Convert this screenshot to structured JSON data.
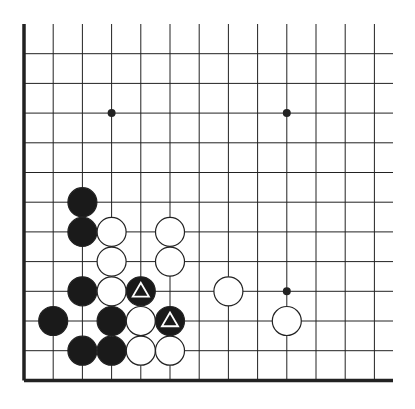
{
  "diagram": {
    "type": "go-board-fragment",
    "corner": "bottom-left",
    "grid": {
      "origin_x": 24,
      "origin_y": 24,
      "spacing_x": 29.2,
      "spacing_y": 29.7,
      "cols": 13,
      "rows": 13,
      "open_right_extent": 393,
      "open_top": true
    },
    "star_points": [
      {
        "col": 3,
        "row": 3
      },
      {
        "col": 9,
        "row": 3
      },
      {
        "col": 9,
        "row": 9
      }
    ],
    "stones": [
      {
        "color": "black",
        "col": 2,
        "row": 6
      },
      {
        "color": "black",
        "col": 2,
        "row": 7
      },
      {
        "color": "white",
        "col": 3,
        "row": 7
      },
      {
        "color": "white",
        "col": 5,
        "row": 7
      },
      {
        "color": "white",
        "col": 3,
        "row": 8
      },
      {
        "color": "white",
        "col": 5,
        "row": 8
      },
      {
        "color": "black",
        "col": 2,
        "row": 9
      },
      {
        "color": "white",
        "col": 3,
        "row": 9
      },
      {
        "color": "black",
        "col": 4,
        "row": 9,
        "mark": "triangle"
      },
      {
        "color": "white",
        "col": 7,
        "row": 9
      },
      {
        "color": "black",
        "col": 1,
        "row": 10
      },
      {
        "color": "black",
        "col": 3,
        "row": 10
      },
      {
        "color": "white",
        "col": 4,
        "row": 10
      },
      {
        "color": "black",
        "col": 5,
        "row": 10,
        "mark": "triangle"
      },
      {
        "color": "white",
        "col": 9,
        "row": 10
      },
      {
        "color": "black",
        "col": 2,
        "row": 11
      },
      {
        "color": "black",
        "col": 3,
        "row": 11
      },
      {
        "color": "white",
        "col": 4,
        "row": 11
      },
      {
        "color": "white",
        "col": 5,
        "row": 11
      }
    ],
    "colors": {
      "line": "#222222",
      "edge": "#111111",
      "black_stone": "#1a1a1a",
      "white_stone": "#ffffff",
      "stone_outline": "#222222",
      "mark": "#ffffff"
    }
  }
}
